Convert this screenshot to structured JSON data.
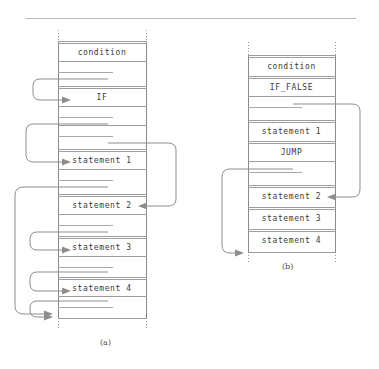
{
  "figure": {
    "caption_a": "(a)",
    "caption_b": "(b)"
  },
  "panel_a": {
    "name": "if-instruction-stream",
    "left": 58,
    "right": 146,
    "cells": [
      {
        "label": "condition",
        "y": 52,
        "kind": "opcode"
      },
      {
        "label": "",
        "y": 72,
        "kind": "blank"
      },
      {
        "label": "IF",
        "y": 97,
        "kind": "opcode"
      },
      {
        "label": "",
        "y": 117,
        "kind": "blank"
      },
      {
        "label": "",
        "y": 136,
        "kind": "blank"
      },
      {
        "label": "statement 1",
        "y": 160,
        "kind": "opcode"
      },
      {
        "label": "",
        "y": 180,
        "kind": "blank"
      },
      {
        "label": "statement 2",
        "y": 205,
        "kind": "opcode"
      },
      {
        "label": "",
        "y": 225,
        "kind": "blank"
      },
      {
        "label": "statement 3",
        "y": 247,
        "kind": "opcode"
      },
      {
        "label": "",
        "y": 267,
        "kind": "blank"
      },
      {
        "label": "statement 4",
        "y": 288,
        "kind": "opcode"
      },
      {
        "label": "",
        "y": 307,
        "kind": "blank"
      }
    ]
  },
  "panel_b": {
    "name": "if-false-jump-instruction-stream",
    "left": 248,
    "right": 335,
    "cells": [
      {
        "label": "condition",
        "y": 66,
        "kind": "opcode"
      },
      {
        "label": "IF_FALSE",
        "y": 87,
        "kind": "opcode"
      },
      {
        "label": "",
        "y": 107,
        "kind": "blank"
      },
      {
        "label": "statement 1",
        "y": 131,
        "kind": "opcode"
      },
      {
        "label": "JUMP",
        "y": 152,
        "kind": "opcode"
      },
      {
        "label": "",
        "y": 172,
        "kind": "blank"
      },
      {
        "label": "statement 2",
        "y": 196,
        "kind": "opcode"
      },
      {
        "label": "statement 3",
        "y": 218,
        "kind": "opcode"
      },
      {
        "label": "statement 4",
        "y": 240,
        "kind": "opcode"
      }
    ]
  },
  "colors": {
    "rule": "#b9b9b9",
    "line": "#9d9d9d",
    "border": "#8a8a8a",
    "arrow": "#8d8d8d",
    "text": "#3a3a3a",
    "background": "#ffffff"
  }
}
